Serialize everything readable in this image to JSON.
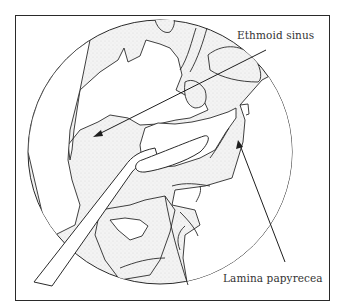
{
  "figure": {
    "type": "endoscopic anatomical line illustration",
    "labels": [
      {
        "id": "ethmoid",
        "text": "Ethmoid sinus",
        "pointer": {
          "from": [
            266,
            50
          ],
          "to": [
            93,
            137
          ]
        }
      },
      {
        "id": "lamina",
        "text": "Lamina papyrecea",
        "pointer": {
          "from": [
            285,
            262
          ],
          "to": [
            238,
            140
          ]
        }
      }
    ],
    "colors": {
      "line": "#2a2a2a",
      "tissue_shade": "#ececec",
      "background": "#ffffff"
    }
  }
}
